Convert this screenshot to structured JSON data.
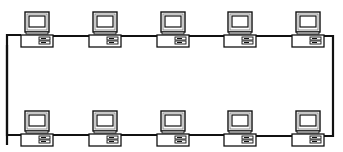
{
  "diagram": {
    "type": "network-topology",
    "topology": "ring",
    "colors": {
      "line": "#111111",
      "background": "#ffffff",
      "screen_shade": "#bbbbbb"
    },
    "rows": [
      {
        "name": "top",
        "nodes": [
          {
            "id": "pc-top-1",
            "x": 20,
            "y": 10
          },
          {
            "id": "pc-top-2",
            "x": 88,
            "y": 10
          },
          {
            "id": "pc-top-3",
            "x": 156,
            "y": 10
          },
          {
            "id": "pc-top-4",
            "x": 223,
            "y": 10
          },
          {
            "id": "pc-top-5",
            "x": 291,
            "y": 10
          }
        ]
      },
      {
        "name": "bottom",
        "nodes": [
          {
            "id": "pc-bottom-1",
            "x": 20,
            "y": 109
          },
          {
            "id": "pc-bottom-2",
            "x": 88,
            "y": 109
          },
          {
            "id": "pc-bottom-3",
            "x": 156,
            "y": 109
          },
          {
            "id": "pc-bottom-4",
            "x": 223,
            "y": 109
          },
          {
            "id": "pc-bottom-5",
            "x": 291,
            "y": 109
          }
        ]
      }
    ],
    "node_icon": "desktop-computer-icon",
    "node_count": 10
  }
}
